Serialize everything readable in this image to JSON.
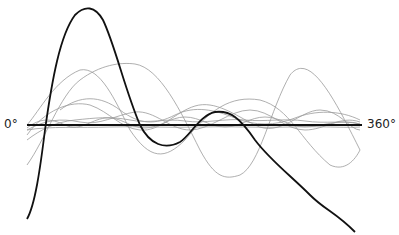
{
  "diagram": {
    "axis": {
      "start_label": "0°",
      "end_label": "360°"
    },
    "colors": {
      "axis": "#111111",
      "primary_curve": "#111111",
      "component_curves": "#9a9a9a"
    },
    "curves": [
      {
        "name": "resultant-wave",
        "style": "thick-dark"
      },
      {
        "name": "component-wave-1",
        "style": "thin-gray"
      },
      {
        "name": "component-wave-2",
        "style": "thin-gray"
      },
      {
        "name": "component-wave-3",
        "style": "thin-gray"
      },
      {
        "name": "component-wave-4",
        "style": "thin-gray"
      },
      {
        "name": "component-wave-5",
        "style": "thin-gray"
      },
      {
        "name": "component-wave-6",
        "style": "thin-gray"
      },
      {
        "name": "component-wave-7",
        "style": "thin-gray"
      },
      {
        "name": "component-wave-8",
        "style": "thin-gray"
      }
    ]
  }
}
